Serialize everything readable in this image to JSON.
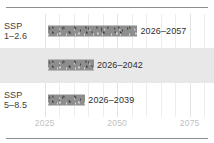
{
  "figure": {
    "clipped_header_text": "· ·",
    "background": "#ffffff",
    "rule_color": "#8d8d8d",
    "band_color": "#e8e8e8",
    "bar_color": "#8e8e8e",
    "tick_color": "#bfbfbf",
    "label_color": "#404040"
  },
  "chart_data": {
    "type": "bar",
    "orientation": "horizontal",
    "title": "",
    "subtitle": "",
    "xlabel": "",
    "ylabel": "",
    "grid": true,
    "legend": null,
    "xlim": [
      2022,
      2082
    ],
    "xticks": [
      2025,
      2050,
      2075
    ],
    "xticklabels": [
      "2025",
      "2050",
      "2075"
    ],
    "categories": [
      "SSP 1–2.6",
      "SSP 2–4.5",
      "SSP 5–8.5"
    ],
    "series": [
      {
        "name": "Range of crossing year",
        "values": [
          {
            "start": 2026,
            "end": 2057
          },
          {
            "start": 2026,
            "end": 2042
          },
          {
            "start": 2026,
            "end": 2039
          }
        ]
      }
    ],
    "annotations": [
      "2026–2057",
      "2026–2042",
      "2026–2039"
    ]
  },
  "rows": [
    {
      "label_line1": "SSP",
      "label_line2": "1–2.6",
      "range_label": "2026–2057",
      "start": 2026,
      "end": 2057,
      "shaded": false
    },
    {
      "label_line1": "SSP",
      "label_line2": "2–4.5",
      "range_label": "2026–2042",
      "start": 2026,
      "end": 2042,
      "shaded": true
    },
    {
      "label_line1": "SSP",
      "label_line2": "5–8.5",
      "range_label": "2026–2039",
      "start": 2026,
      "end": 2039,
      "shaded": false
    }
  ],
  "xaxis": {
    "ticks": [
      {
        "label": "2025",
        "value": 2025
      },
      {
        "label": "2050",
        "value": 2050
      },
      {
        "label": "2075",
        "value": 2075
      }
    ]
  },
  "gridlines": {
    "values": [
      2025,
      2030,
      2035,
      2040,
      2045,
      2050,
      2055,
      2060,
      2065,
      2070,
      2075,
      2080
    ],
    "major": [
      2025,
      2050,
      2075
    ]
  }
}
